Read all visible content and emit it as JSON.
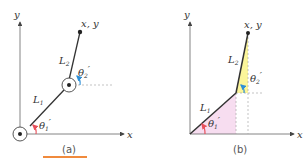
{
  "panels": [
    {
      "id": "a",
      "caption": "(a)",
      "axis_x": "x",
      "axis_y": "y",
      "endpoint_label": "x, y",
      "link1_label": "L",
      "link1_sub": "1",
      "link2_label": "L",
      "link2_sub": "2",
      "angle1_label": "θ",
      "angle1_sub": "1",
      "angle1_prime": "′",
      "angle2_label": "θ",
      "angle2_sub": "2",
      "angle2_prime": "′"
    },
    {
      "id": "b",
      "caption": "(b)",
      "axis_x": "x",
      "axis_y": "y",
      "endpoint_label": "x, y",
      "link1_label": "L",
      "link1_sub": "1",
      "link2_label": "L",
      "link2_sub": "2",
      "angle1_label": "θ",
      "angle1_sub": "1",
      "angle1_prime": "′",
      "angle2_label": "θ",
      "angle2_sub": "2",
      "angle2_prime": "′"
    }
  ],
  "colors": {
    "angle1_arrow": "#e8505b",
    "angle2_arrow": "#2e8fd6",
    "triangle1_fill": "#f7ddf0",
    "triangle2_fill": "#fbf59a",
    "accent_bar": "#f08a3c"
  }
}
